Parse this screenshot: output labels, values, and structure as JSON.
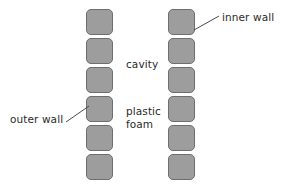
{
  "diagram": {
    "background_color": "#ffffff",
    "block_fill_color": "#9d9d9d",
    "block_stroke_color": "#6e6e6e",
    "text_color": "#2a2a2a",
    "leader_color": "#4a4a4a"
  },
  "columns": [
    {
      "name": "outer wall column",
      "block_count": 6,
      "blocks": [
        {
          "index": 1
        },
        {
          "index": 2
        },
        {
          "index": 3
        },
        {
          "index": 4
        },
        {
          "index": 5
        },
        {
          "index": 6
        }
      ]
    },
    {
      "name": "inner wall column",
      "block_count": 6,
      "blocks": [
        {
          "index": 1
        },
        {
          "index": 2
        },
        {
          "index": 3
        },
        {
          "index": 4
        },
        {
          "index": 5
        },
        {
          "index": 6
        }
      ]
    }
  ],
  "labels": {
    "inner_wall": "inner wall",
    "outer_wall": "outer wall",
    "cavity": "cavity",
    "plastic_foam": "plastic\nfoam"
  },
  "leaders": [
    {
      "name": "inner-wall-leader",
      "from_x": 219,
      "from_y": 16,
      "to_x": 194,
      "to_y": 30
    },
    {
      "name": "outer-wall-leader",
      "from_x": 66,
      "from_y": 122,
      "to_x": 89,
      "to_y": 106
    }
  ]
}
